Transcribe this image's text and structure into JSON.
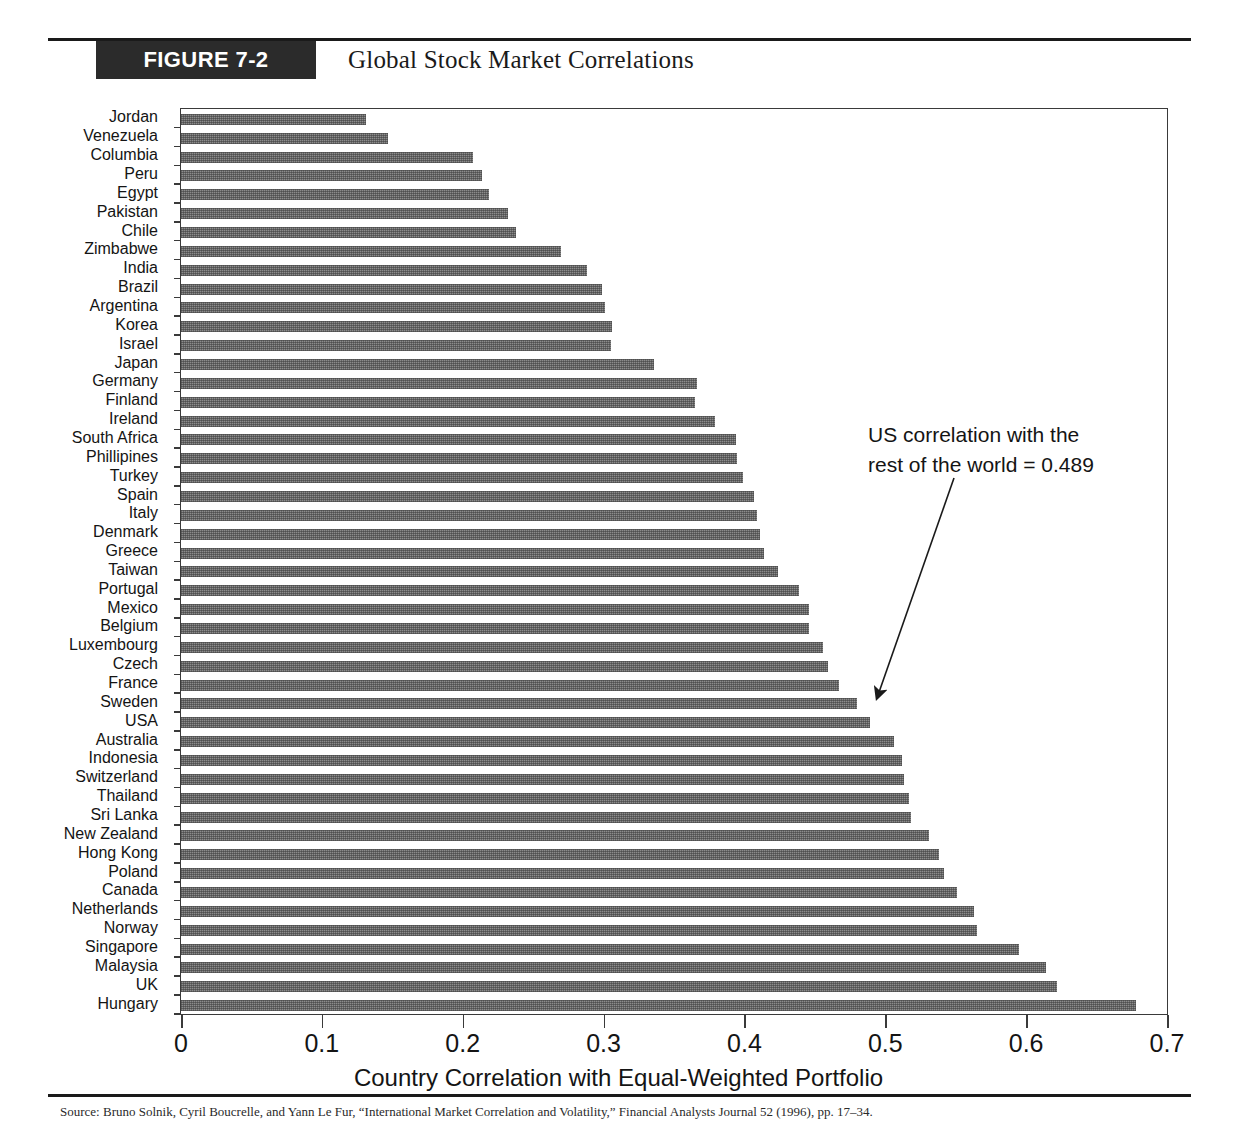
{
  "figure": {
    "badge": "FIGURE 7-2",
    "title": "Global Stock Market Correlations",
    "footer_note": "Source: Bruno Solnik, Cyril Boucrelle, and Yann Le Fur, “International Market Correlation and Volatility,” Financial Analysts Journal 52 (1996), pp. 17–34."
  },
  "annotation": {
    "line1": "US correlation with the",
    "line2": "rest of the world = 0.489"
  },
  "chart_data": {
    "type": "bar",
    "orientation": "horizontal",
    "title": "Global Stock Market Correlations",
    "xlabel": "Country Correlation with Equal-Weighted Portfolio",
    "ylabel": "",
    "xlim": [
      0,
      0.7
    ],
    "xticks": [
      0,
      0.1,
      0.2,
      0.3,
      0.4,
      0.5,
      0.6,
      0.7
    ],
    "xticklabels": [
      "0",
      "0.1",
      "0.2",
      "0.3",
      "0.4",
      "0.5",
      "0.6",
      "0.7"
    ],
    "grid": false,
    "legend": null,
    "bar_color": "#8c8c8c",
    "categories": [
      "Jordan",
      "Venezuela",
      "Columbia",
      "Peru",
      "Egypt",
      "Pakistan",
      "Chile",
      "Zimbabwe",
      "India",
      "Brazil",
      "Argentina",
      "Korea",
      "Israel",
      "Japan",
      "Germany",
      "Finland",
      "Ireland",
      "South Africa",
      "Phillipines",
      "Turkey",
      "Spain",
      "Italy",
      "Denmark",
      "Greece",
      "Taiwan",
      "Portugal",
      "Mexico",
      "Belgium",
      "Luxembourg",
      "Czech",
      "France",
      "Sweden",
      "USA",
      "Australia",
      "Indonesia",
      "Switzerland",
      "Thailand",
      "Sri Lanka",
      "New Zealand",
      "Hong Kong",
      "Poland",
      "Canada",
      "Netherlands",
      "Norway",
      "Singapore",
      "Malaysia",
      "UK",
      "Hungary"
    ],
    "values": [
      0.131,
      0.147,
      0.207,
      0.214,
      0.219,
      0.232,
      0.238,
      0.27,
      0.288,
      0.299,
      0.301,
      0.306,
      0.305,
      0.336,
      0.366,
      0.365,
      0.379,
      0.394,
      0.395,
      0.399,
      0.407,
      0.409,
      0.411,
      0.414,
      0.424,
      0.439,
      0.446,
      0.446,
      0.456,
      0.459,
      0.467,
      0.48,
      0.489,
      0.506,
      0.512,
      0.513,
      0.517,
      0.518,
      0.531,
      0.538,
      0.542,
      0.551,
      0.563,
      0.565,
      0.595,
      0.614,
      0.622,
      0.678
    ],
    "highlight": {
      "category": "USA",
      "value": 0.489
    }
  }
}
